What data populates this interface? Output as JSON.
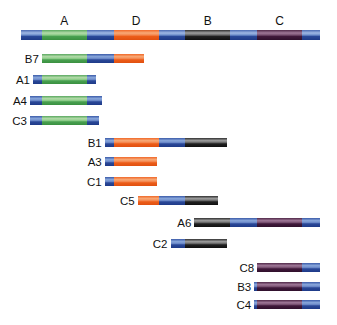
{
  "diagram": {
    "type": "physical-map",
    "map_range": [
      0,
      100
    ],
    "region_colors": {
      "spacer": "#2f4fa0",
      "A": "#4aa050",
      "D": "#f06020",
      "B": "#202020",
      "C": "#4a2040"
    },
    "regions": [
      {
        "label": "A",
        "start": 7,
        "end": 22
      },
      {
        "label": "D",
        "start": 31,
        "end": 46
      },
      {
        "label": "B",
        "start": 55,
        "end": 70
      },
      {
        "label": "C",
        "start": 79,
        "end": 94
      }
    ],
    "main_map": [
      {
        "type": "spacer",
        "start": 0,
        "end": 7
      },
      {
        "type": "A",
        "start": 7,
        "end": 22
      },
      {
        "type": "spacer",
        "start": 22,
        "end": 31
      },
      {
        "type": "D",
        "start": 31,
        "end": 46
      },
      {
        "type": "spacer",
        "start": 46,
        "end": 55
      },
      {
        "type": "B",
        "start": 55,
        "end": 70
      },
      {
        "type": "spacer",
        "start": 70,
        "end": 79
      },
      {
        "type": "C",
        "start": 79,
        "end": 94
      },
      {
        "type": "spacer",
        "start": 94,
        "end": 100
      }
    ],
    "clones": [
      {
        "label": "B7",
        "segments": [
          {
            "type": "A",
            "start": 7,
            "end": 22
          },
          {
            "type": "spacer",
            "start": 22,
            "end": 31
          },
          {
            "type": "D",
            "start": 31,
            "end": 41
          }
        ]
      },
      {
        "label": "A1",
        "segments": [
          {
            "type": "spacer",
            "start": 4,
            "end": 7
          },
          {
            "type": "A",
            "start": 7,
            "end": 22
          },
          {
            "type": "spacer",
            "start": 22,
            "end": 25
          }
        ]
      },
      {
        "label": "A4",
        "segments": [
          {
            "type": "spacer",
            "start": 3,
            "end": 7
          },
          {
            "type": "A",
            "start": 7,
            "end": 22
          },
          {
            "type": "spacer",
            "start": 22,
            "end": 27
          }
        ]
      },
      {
        "label": "C3",
        "segments": [
          {
            "type": "spacer",
            "start": 3,
            "end": 7
          },
          {
            "type": "A",
            "start": 7,
            "end": 22
          },
          {
            "type": "spacer",
            "start": 22,
            "end": 26
          }
        ]
      },
      {
        "label": "B1",
        "segments": [
          {
            "type": "spacer",
            "start": 28,
            "end": 31
          },
          {
            "type": "D",
            "start": 31,
            "end": 46
          },
          {
            "type": "spacer",
            "start": 46,
            "end": 55
          },
          {
            "type": "B",
            "start": 55,
            "end": 69
          }
        ]
      },
      {
        "label": "A3",
        "segments": [
          {
            "type": "spacer",
            "start": 28,
            "end": 31
          },
          {
            "type": "D",
            "start": 31,
            "end": 45.5
          }
        ]
      },
      {
        "label": "C1",
        "segments": [
          {
            "type": "spacer",
            "start": 28,
            "end": 31
          },
          {
            "type": "D",
            "start": 31,
            "end": 45.5
          }
        ]
      },
      {
        "label": "C5",
        "segments": [
          {
            "type": "D",
            "start": 39,
            "end": 46
          },
          {
            "type": "spacer",
            "start": 46,
            "end": 55
          },
          {
            "type": "B",
            "start": 55,
            "end": 66
          }
        ]
      },
      {
        "label": "A6",
        "segments": [
          {
            "type": "B",
            "start": 58,
            "end": 70
          },
          {
            "type": "spacer",
            "start": 70,
            "end": 79
          },
          {
            "type": "C",
            "start": 79,
            "end": 94
          },
          {
            "type": "spacer",
            "start": 94,
            "end": 100
          }
        ]
      },
      {
        "label": "C2",
        "segments": [
          {
            "type": "spacer",
            "start": 50,
            "end": 55
          },
          {
            "type": "B",
            "start": 55,
            "end": 69
          }
        ]
      },
      {
        "label": "C8",
        "segments": [
          {
            "type": "C",
            "start": 79,
            "end": 94
          },
          {
            "type": "spacer",
            "start": 94,
            "end": 100
          }
        ]
      },
      {
        "label": "B3",
        "segments": [
          {
            "type": "spacer",
            "start": 78,
            "end": 79
          },
          {
            "type": "C",
            "start": 79,
            "end": 94
          },
          {
            "type": "spacer",
            "start": 94,
            "end": 100
          }
        ]
      },
      {
        "label": "C4",
        "segments": [
          {
            "type": "spacer",
            "start": 78,
            "end": 79
          },
          {
            "type": "C",
            "start": 79,
            "end": 94
          },
          {
            "type": "spacer",
            "start": 94,
            "end": 100
          }
        ]
      }
    ]
  }
}
